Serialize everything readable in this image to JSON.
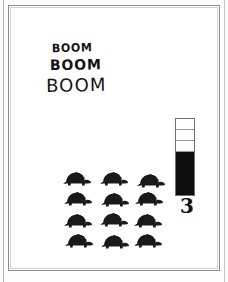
{
  "page": {
    "background_color": "#ffffff",
    "frame_color": "#8d8d8d",
    "inner_frame_color": "#d2d2d2"
  },
  "lettering": {
    "lines": [
      {
        "text": "BOOM",
        "size": "small"
      },
      {
        "text": "BOOM",
        "size": "medium"
      },
      {
        "text": "BOOM",
        "size": "large"
      }
    ]
  },
  "turtles": {
    "icon_name": "turtle-icon",
    "color": "#1a1a1a",
    "rows": 4,
    "columns": 3,
    "count": 12,
    "items": [
      "turtle",
      "turtle",
      "turtle",
      "turtle",
      "turtle",
      "turtle",
      "turtle",
      "turtle",
      "turtle",
      "turtle",
      "turtle",
      "turtle"
    ]
  },
  "gauge": {
    "name": "segmented-level-gauge",
    "total_segments": 7,
    "empty_segments": 3,
    "filled_segments": 4,
    "value_label": "3",
    "fill_color": "#0d0d0d",
    "empty_color": "#ffffff",
    "border_color": "#6f6f6f"
  },
  "chart_data": {
    "type": "bar",
    "title": "",
    "categories": [
      "level"
    ],
    "values": [
      3
    ],
    "ylim": [
      0,
      7
    ],
    "ylabel": "",
    "xlabel": "",
    "grid": true,
    "legend": false,
    "annotations": [
      "3"
    ]
  }
}
